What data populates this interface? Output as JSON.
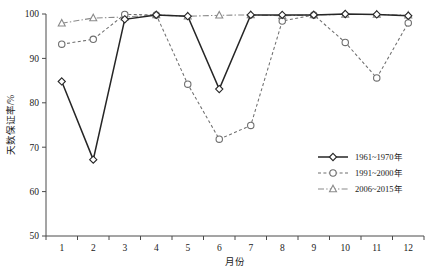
{
  "chart_data": {
    "type": "line",
    "title": "",
    "xlabel": "月份",
    "ylabel": "天数保证率/%",
    "xlim": [
      0.5,
      12.5
    ],
    "ylim": [
      50,
      100
    ],
    "grid": false,
    "legend_position": "right-middle",
    "categories": [
      1,
      2,
      3,
      4,
      5,
      6,
      7,
      8,
      9,
      10,
      11,
      12
    ],
    "xticklabels": [
      "1",
      "2",
      "3",
      "4",
      "5",
      "6",
      "7",
      "8",
      "9",
      "10",
      "11",
      "12"
    ],
    "yticklabels": [
      "50",
      "60",
      "70",
      "80",
      "90",
      "100"
    ],
    "yticks": [
      50,
      60,
      70,
      80,
      90,
      100
    ],
    "series": [
      {
        "name": "1961~1970年",
        "marker": "diamond",
        "linestyle": "solid",
        "color": "#262626",
        "values": [
          84.8,
          67.2,
          98.8,
          99.8,
          99.5,
          83.1,
          99.8,
          99.8,
          99.8,
          100.0,
          99.9,
          99.6
        ]
      },
      {
        "name": "1991~2000年",
        "marker": "circle",
        "linestyle": "dotted",
        "color": "#6e6e6e",
        "values": [
          93.2,
          94.3,
          99.9,
          99.8,
          84.2,
          71.8,
          74.9,
          98.4,
          99.8,
          93.6,
          85.6,
          98.0
        ]
      },
      {
        "name": "2006~2015年",
        "marker": "triangle",
        "linestyle": "dashdot",
        "color": "#8a8a8a",
        "values": [
          97.9,
          99.1,
          99.3,
          99.8,
          99.5,
          99.7,
          99.8,
          99.6,
          99.8,
          99.9,
          99.9,
          99.7
        ]
      }
    ]
  },
  "legend": {
    "items": [
      {
        "label": "1961~1970年"
      },
      {
        "label": "1991~2000年"
      },
      {
        "label": "2006~2015年"
      }
    ]
  },
  "axes": {
    "x_title": "月份",
    "y_title": "天数保证率/%"
  }
}
